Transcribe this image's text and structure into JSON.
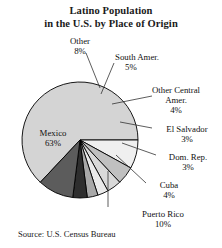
{
  "chart_data": {
    "type": "pie",
    "title": "Latino Population in the U.S. by Place of Origin",
    "title_lines": [
      "Latino Population",
      "in the U.S. by Place of Origin"
    ],
    "source": "Source: U.S. Census Bureau",
    "unit": "%",
    "legend": "none",
    "labels_position": "outside-with-leader-lines",
    "categories": [
      "Mexico",
      "Other",
      "South Amer.",
      "Other Central Amer.",
      "El Salvador",
      "Dom. Rep.",
      "Cuba",
      "Puerto Rico"
    ],
    "values": [
      63,
      8,
      5,
      4,
      3,
      3,
      4,
      10
    ],
    "slices": [
      {
        "name": "Mexico",
        "value": 63,
        "label": "Mexico",
        "percent_text": "63%",
        "color": "#d4d4d4"
      },
      {
        "name": "Other",
        "value": 8,
        "label": "Other",
        "percent_text": "8%",
        "color": "#efefef"
      },
      {
        "name": "South Amer.",
        "value": 5,
        "label": "South Amer.",
        "percent_text": "5%",
        "color": "#c0c0c0"
      },
      {
        "name": "Other Central Amer.",
        "value": 4,
        "label_lines": [
          "Other Central",
          "Amer."
        ],
        "percent_text": "4%",
        "color": "#d9d9d9"
      },
      {
        "name": "El Salvador",
        "value": 3,
        "label": "El Salvador",
        "percent_text": "3%",
        "color": "#eaeaea"
      },
      {
        "name": "Dom. Rep.",
        "value": 3,
        "label": "Dom. Rep.",
        "percent_text": "3%",
        "color": "#a8a8a8"
      },
      {
        "name": "Cuba",
        "value": 4,
        "label": "Cuba",
        "percent_text": "4%",
        "color": "#2e2e2e"
      },
      {
        "name": "Puerto Rico",
        "value": 10,
        "label": "Puerto Rico",
        "percent_text": "10%",
        "color": "#5c5c5c"
      }
    ],
    "total": 100
  },
  "labels": {
    "mexico": {
      "name": "Mexico",
      "percent": "63%"
    },
    "other": {
      "name": "Other",
      "percent": "8%"
    },
    "south_amer": {
      "name": "South Amer.",
      "percent": "5%"
    },
    "other_central": {
      "name1": "Other Central",
      "name2": "Amer.",
      "percent": "4%"
    },
    "el_salvador": {
      "name": "El Salvador",
      "percent": "3%"
    },
    "dom_rep": {
      "name": "Dom. Rep.",
      "percent": "3%"
    },
    "cuba": {
      "name": "Cuba",
      "percent": "4%"
    },
    "puerto_rico": {
      "name": "Puerto Rico",
      "percent": "10%"
    }
  },
  "title": {
    "line1": "Latino Population",
    "line2": "in the U.S. by Place of Origin"
  },
  "footer": {
    "source": "Source: U.S. Census Bureau"
  },
  "colors": {
    "text": "#111111",
    "outline": "#000000",
    "background": "#ffffff"
  }
}
